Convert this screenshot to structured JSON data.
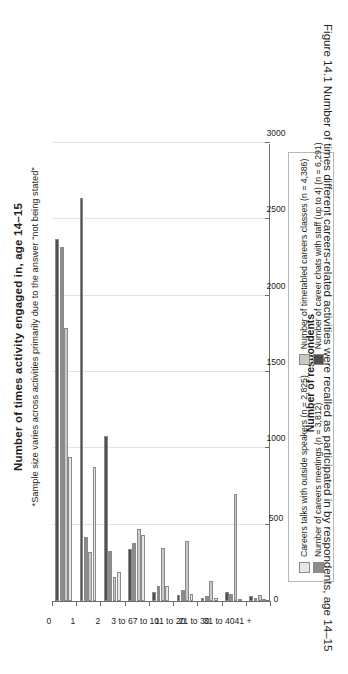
{
  "figure": {
    "caption": "Figure 14.1  Number of times different careers-related activities were recalled as participated in by respondents, age 14–15"
  },
  "chart_data": {
    "type": "bar",
    "title": "Number of times activity engaged in, age 14–15",
    "subtitle": "*Sample size varies across activities primarily due to the answer “not being stated”",
    "xlabel": "",
    "ylabel": "Number of respondents",
    "ylim": [
      0,
      3000
    ],
    "yticks": [
      0,
      500,
      1000,
      1500,
      2000,
      2500,
      3000
    ],
    "grid": true,
    "legend_position": "bottom",
    "orientation": "vertical",
    "categories": [
      "0",
      "1",
      "2",
      "3 to 6",
      "7 to 10",
      "11 to 20",
      "21 to 30",
      "31 to 40",
      "41 +"
    ],
    "series": [
      {
        "name": "Careers talks with outside speakers (n = 2,825)",
        "color": "#e8e8e4",
        "values": [
          940,
          880,
          190,
          430,
          95,
          45,
          18,
          10,
          5
        ]
      },
      {
        "name": "Number of timetabled careers classes (n = 4,386)",
        "color": "#c9c9c6",
        "values": [
          1790,
          320,
          160,
          470,
          350,
          390,
          130,
          700,
          40
        ]
      },
      {
        "name": "Number of careers meetings (n = 3,812)",
        "color": "#8c8c8c",
        "values": [
          2320,
          420,
          330,
          380,
          100,
          75,
          35,
          45,
          18
        ]
      },
      {
        "name": "Number of career chats with staff (up to 4) (n = 6,291)",
        "color": "#4f4f4f",
        "values": [
          2370,
          2640,
          1080,
          340,
          60,
          40,
          22,
          60,
          30
        ]
      }
    ]
  }
}
